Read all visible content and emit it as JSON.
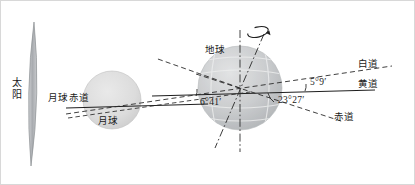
{
  "diagram": {
    "title_present": false,
    "bodies": {
      "sun": {
        "name": "sun-body",
        "label": "太阳",
        "shape": "lens-arc",
        "fill": "#b9bcc0"
      },
      "moon": {
        "name": "moon-body",
        "label": "月球",
        "shape": "circle",
        "fill": "#dcdcdc",
        "radius": 29
      },
      "earth": {
        "name": "earth-body",
        "label": "地球",
        "shape": "sphere",
        "fill": "#c9cbcd",
        "radius": 42
      }
    },
    "labels": {
      "sun": "太阳",
      "moon": "月球",
      "moon_equator": "月球赤道",
      "earth": "地球",
      "lunar_orbit": "白道",
      "ecliptic": "黄道",
      "celestial_equator": "赤道"
    },
    "angles": {
      "moon_equator_inclination": "6°41′",
      "lunar_orbit_inclination": "5°9′",
      "earth_axial_tilt": "23°27′"
    },
    "icons": {
      "rotation": "rotation-arrow-icon"
    },
    "colors": {
      "line": "#1f1f1f",
      "dashed": "#2a2a2a",
      "earth_fill": "#c9cbcd",
      "moon_fill": "#dcdcdc",
      "sun_fill": "#b9bcc0",
      "frame": "#d8d8d8"
    }
  }
}
